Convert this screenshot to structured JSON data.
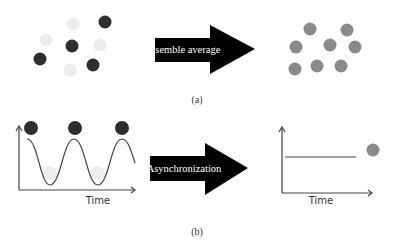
{
  "panel_a": {
    "caption": "(a)",
    "arrow_label": "Ensemble average",
    "left_dots": [
      {
        "cx": 73,
        "cy": 24,
        "shade": "light"
      },
      {
        "cx": 105,
        "cy": 22,
        "shade": "dark"
      },
      {
        "cx": 46,
        "cy": 40,
        "shade": "light"
      },
      {
        "cx": 72,
        "cy": 46,
        "shade": "dark"
      },
      {
        "cx": 100,
        "cy": 45,
        "shade": "light"
      },
      {
        "cx": 40,
        "cy": 59,
        "shade": "dark"
      },
      {
        "cx": 70,
        "cy": 70,
        "shade": "light"
      },
      {
        "cx": 93,
        "cy": 65,
        "shade": "dark"
      }
    ],
    "right_dots": [
      {
        "cx": 310,
        "cy": 29
      },
      {
        "cx": 347,
        "cy": 30
      },
      {
        "cx": 296,
        "cy": 47
      },
      {
        "cx": 330,
        "cy": 45
      },
      {
        "cx": 355,
        "cy": 47
      },
      {
        "cx": 295,
        "cy": 69
      },
      {
        "cx": 317,
        "cy": 66
      },
      {
        "cx": 341,
        "cy": 66
      }
    ]
  },
  "panel_b": {
    "caption": "(b)",
    "arrow_label": "Asynchronization",
    "left_plot": {
      "x_label": "Time"
    },
    "right_plot": {
      "x_label": "Time"
    }
  },
  "colors": {
    "dark_dot": "#2e2e2e",
    "light_dot": "#ececec",
    "mid_dot": "#8a8a8a",
    "arrow": "#000000",
    "axis": "#444444"
  }
}
